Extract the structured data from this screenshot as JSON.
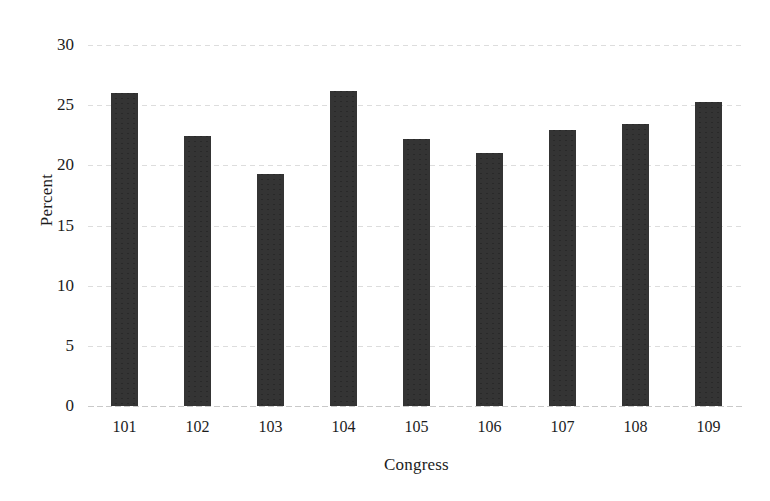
{
  "chart_data": {
    "type": "bar",
    "title": "",
    "xlabel": "Congress",
    "ylabel": "Percent",
    "categories": [
      "101",
      "102",
      "103",
      "104",
      "105",
      "106",
      "107",
      "108",
      "109"
    ],
    "values": [
      26.0,
      22.4,
      19.3,
      26.2,
      22.2,
      21.0,
      22.9,
      23.4,
      25.3
    ],
    "series": [
      {
        "name": "Percent",
        "values": [
          26.0,
          22.4,
          19.3,
          26.2,
          22.2,
          21.0,
          22.9,
          23.4,
          25.3
        ]
      }
    ],
    "ylim": [
      0,
      30
    ],
    "yticks": [
      0,
      5,
      10,
      15,
      20,
      25,
      30
    ],
    "ytick_labels": [
      "0",
      "5",
      "10",
      "15",
      "20",
      "25",
      "30"
    ],
    "grid": true,
    "grid_axis": "y",
    "legend": false,
    "legend_position": "none",
    "bar_color": "#343434",
    "gridline_color": "#d7d7d7",
    "text_color": "#1c1c1c",
    "background_color": "#ffffff"
  }
}
